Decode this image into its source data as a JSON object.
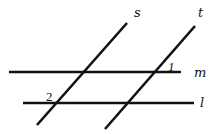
{
  "diagram": {
    "lines": [
      {
        "id": "m",
        "label": "m",
        "type": "horizontal",
        "x1": 9,
        "y1": 72,
        "x2": 181,
        "y2": 72
      },
      {
        "id": "l",
        "label": "l",
        "type": "horizontal",
        "x1": 23,
        "y1": 103,
        "x2": 194,
        "y2": 103
      },
      {
        "id": "s",
        "label": "s",
        "type": "transversal",
        "x1": 127,
        "y1": 23,
        "x2": 37,
        "y2": 125
      },
      {
        "id": "t",
        "label": "t",
        "type": "transversal",
        "x1": 195,
        "y1": 26,
        "x2": 105,
        "y2": 129
      }
    ],
    "labels": {
      "s": "s",
      "t": "t",
      "m": "m",
      "l": "l"
    },
    "angles": {
      "angle1": "1",
      "angle2": "2"
    },
    "color": "#111111",
    "background": "#ffffff"
  }
}
